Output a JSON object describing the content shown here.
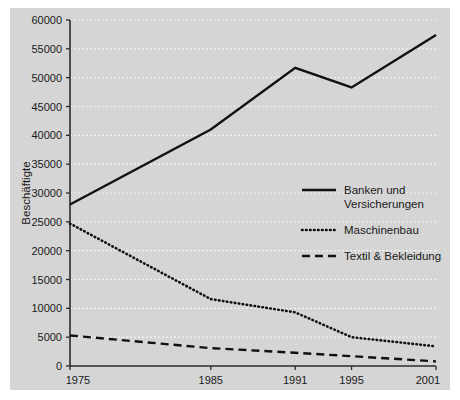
{
  "figure": {
    "background_color": "#d5d5d5",
    "page_background_color": "#ffffff",
    "axis_color": "#2a2a2a",
    "gridline_color": "#f2f2f2",
    "series_color": "#111111"
  },
  "chart_data": {
    "type": "line",
    "title": "",
    "xlabel": "",
    "ylabel": "Beschäftigte",
    "x": [
      1975,
      1985,
      1991,
      1995,
      2001
    ],
    "xtick_labels": [
      "1975",
      "1985",
      "1991",
      "1995",
      "2001"
    ],
    "xlim": [
      1975,
      2001
    ],
    "ylim": [
      0,
      60000
    ],
    "yticks": [
      0,
      5000,
      10000,
      15000,
      20000,
      25000,
      30000,
      35000,
      40000,
      45000,
      50000,
      55000,
      60000
    ],
    "ytick_labels": [
      "0",
      "5000",
      "10000",
      "15000",
      "20000",
      "25000",
      "30000",
      "35000",
      "40000",
      "45000",
      "50000",
      "55000",
      "60000"
    ],
    "grid": true,
    "legend_position": "center-right",
    "series": [
      {
        "name": "Banken und Versicherungen",
        "style": "solid",
        "values": [
          28000,
          41000,
          51700,
          48300,
          57400
        ]
      },
      {
        "name": "Maschinenbau",
        "style": "dotted",
        "values": [
          24700,
          11600,
          9300,
          5000,
          3400
        ]
      },
      {
        "name": "Textil & Bekleidung",
        "style": "dashed",
        "values": [
          5300,
          3100,
          2300,
          1700,
          800
        ]
      }
    ]
  },
  "legend": {
    "entries": [
      {
        "label_line1": "Banken und",
        "label_line2": "Versicherungen",
        "style": "solid"
      },
      {
        "label_line1": "Maschinenbau",
        "label_line2": "",
        "style": "dotted"
      },
      {
        "label_line1": "Textil & Bekleidung",
        "label_line2": "",
        "style": "dashed"
      }
    ]
  }
}
